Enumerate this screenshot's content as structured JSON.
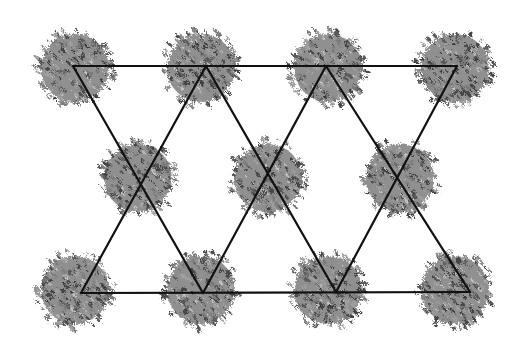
{
  "diagram": {
    "background": "#ffffff",
    "line_color": "#111111",
    "line_width": 2.2,
    "foliage": {
      "radius": 40,
      "colors": [
        "#5a5a5a",
        "#7a7a7a",
        "#8e8e8e",
        "#444444",
        "#a0a0a0"
      ]
    },
    "nodes": [
      {
        "id": "t1",
        "row": "top",
        "x": 75,
        "y": 68
      },
      {
        "id": "t2",
        "row": "top",
        "x": 201,
        "y": 68
      },
      {
        "id": "t3",
        "row": "top",
        "x": 328,
        "y": 68
      },
      {
        "id": "t4",
        "row": "top",
        "x": 455,
        "y": 68
      },
      {
        "id": "m1",
        "row": "middle",
        "x": 138,
        "y": 178
      },
      {
        "id": "m2",
        "row": "middle",
        "x": 268,
        "y": 178
      },
      {
        "id": "m3",
        "row": "middle",
        "x": 400,
        "y": 178
      },
      {
        "id": "b1",
        "row": "bottom",
        "x": 75,
        "y": 290
      },
      {
        "id": "b2",
        "row": "bottom",
        "x": 201,
        "y": 290
      },
      {
        "id": "b3",
        "row": "bottom",
        "x": 328,
        "y": 290
      },
      {
        "id": "b4",
        "row": "bottom",
        "x": 455,
        "y": 290
      }
    ],
    "lines": [
      {
        "id": "top-edge",
        "x1": 73,
        "y1": 66,
        "x2": 457,
        "y2": 66
      },
      {
        "id": "bottom-edge",
        "x1": 81,
        "y1": 293,
        "x2": 470,
        "y2": 292
      },
      {
        "id": "diag-1",
        "x1": 73,
        "y1": 66,
        "x2": 203,
        "y2": 293
      },
      {
        "id": "diag-2",
        "x1": 206,
        "y1": 66,
        "x2": 81,
        "y2": 293
      },
      {
        "id": "diag-3",
        "x1": 206,
        "y1": 66,
        "x2": 336,
        "y2": 292
      },
      {
        "id": "diag-4",
        "x1": 326,
        "y1": 66,
        "x2": 203,
        "y2": 293
      },
      {
        "id": "diag-5",
        "x1": 326,
        "y1": 66,
        "x2": 470,
        "y2": 292
      },
      {
        "id": "diag-6",
        "x1": 457,
        "y1": 66,
        "x2": 336,
        "y2": 292
      }
    ]
  }
}
